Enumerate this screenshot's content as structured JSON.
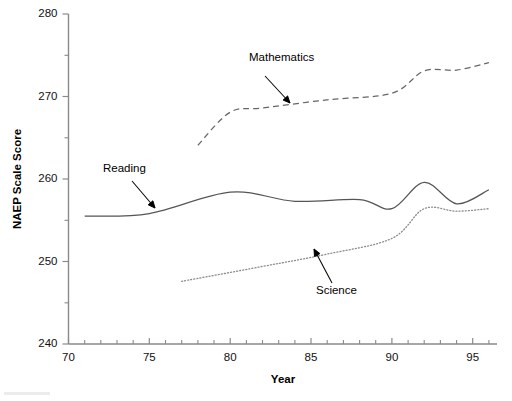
{
  "chart_data": {
    "type": "line",
    "title": "",
    "xlabel": "Year",
    "ylabel": "NAEP Scale Score",
    "xlim": [
      70,
      96.5
    ],
    "ylim": [
      240,
      280
    ],
    "grid": false,
    "legend": "inline annotations with arrows",
    "y_ticks_major": [
      240,
      250,
      260,
      270,
      280
    ],
    "y_ticks_minor": [
      245,
      255,
      265,
      275
    ],
    "x_ticks_major": [
      70,
      75,
      80,
      85,
      90,
      95
    ],
    "x_ticks_minor": [
      71,
      72,
      73,
      74,
      76,
      77,
      78,
      79,
      81,
      82,
      83,
      84,
      86,
      87,
      88,
      89,
      91,
      92,
      93,
      94,
      96
    ],
    "series": [
      {
        "name": "Mathematics",
        "style": "dashed",
        "color": "#666666",
        "x": [
          78,
          80,
          82,
          86,
          90,
          92,
          94,
          96
        ],
        "values": [
          264.1,
          268.1,
          268.6,
          269.6,
          270.4,
          273.1,
          273.2,
          274.1
        ]
      },
      {
        "name": "Reading",
        "style": "solid",
        "color": "#555555",
        "x": [
          71,
          75,
          80,
          84,
          88,
          90,
          92,
          94,
          96
        ],
        "values": [
          255.5,
          255.8,
          258.4,
          257.3,
          257.5,
          256.4,
          259.6,
          257.0,
          258.7
        ]
      },
      {
        "name": "Science",
        "style": "dotted",
        "color": "#8c8c8c",
        "x": [
          77,
          82,
          86,
          90,
          92,
          94,
          96
        ],
        "values": [
          247.6,
          249.4,
          250.9,
          252.8,
          256.4,
          256.1,
          256.4
        ]
      }
    ],
    "annotations": [
      {
        "label": "Mathematics",
        "label_x": 249,
        "label_y": 61,
        "arrow_from_x": 265,
        "arrow_from_y": 76,
        "arrow_to_x": 290,
        "arrow_to_y": 103
      },
      {
        "label": "Reading",
        "label_x": 103,
        "label_y": 172,
        "arrow_from_x": 132,
        "arrow_from_y": 181,
        "arrow_to_x": 155,
        "arrow_to_y": 208
      },
      {
        "label": "Science",
        "label_x": 316,
        "label_y": 294,
        "arrow_from_x": 332,
        "arrow_from_y": 283,
        "arrow_to_x": 314,
        "arrow_to_y": 249
      }
    ]
  },
  "axis": {
    "y_label": "NAEP Scale Score",
    "x_label": "Year",
    "y_tick_labels": [
      "280",
      "270",
      "260",
      "250",
      "240"
    ],
    "x_tick_labels": [
      "70",
      "75",
      "80",
      "85",
      "90",
      "95"
    ]
  },
  "labels": {
    "mathematics": "Mathematics",
    "reading": "Reading",
    "science": "Science"
  }
}
